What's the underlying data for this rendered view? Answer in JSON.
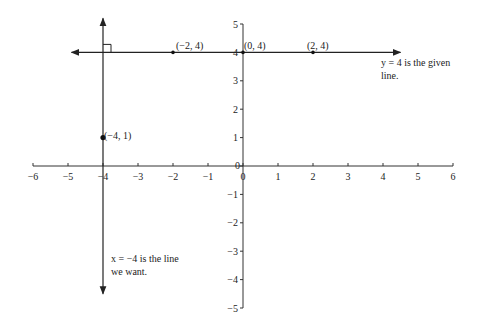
{
  "chart_data": {
    "type": "line",
    "title": "",
    "xlabel": "",
    "ylabel": "",
    "xlim": [
      -6,
      6
    ],
    "ylim": [
      -5,
      5
    ],
    "grid": false,
    "x_ticks": [
      -6,
      -5,
      -4,
      -3,
      -2,
      -1,
      0,
      1,
      2,
      3,
      4,
      5,
      6
    ],
    "y_ticks": [
      -5,
      -4,
      -3,
      -2,
      -1,
      0,
      1,
      2,
      3,
      4,
      5
    ],
    "x_tick_labels": [
      "−6",
      "−5",
      "−4",
      "−3",
      "−2",
      "−1",
      "0",
      "1",
      "2",
      "3",
      "4",
      "5",
      "6"
    ],
    "y_tick_labels": [
      "−5",
      "−4",
      "−3",
      "−2",
      "−1",
      "0",
      "1",
      "2",
      "3",
      "4",
      "5"
    ],
    "series": [
      {
        "name": "y = 4",
        "kind": "horizontal-line",
        "y": 4,
        "x_range": [
          -4.9,
          4.5
        ],
        "arrows": "both"
      },
      {
        "name": "x = −4",
        "kind": "vertical-line",
        "x": -4,
        "y_range": [
          -4.5,
          5.2
        ],
        "arrows": "both"
      }
    ],
    "points": [
      {
        "x": -2,
        "y": 4,
        "label": "(−2, 4)"
      },
      {
        "x": 0,
        "y": 4,
        "label": "(0, 4)"
      },
      {
        "x": 2,
        "y": 4,
        "label": "(2, 4)"
      },
      {
        "x": -4,
        "y": 1,
        "label": "(−4, 1)"
      }
    ],
    "annotations": [
      {
        "text": "y = 4 is the given line.",
        "lines": [
          "y = 4 is the given",
          "line."
        ]
      },
      {
        "text": "x = −4 is the line we want.",
        "lines": [
          "x = −4 is the line",
          "we want."
        ]
      },
      {
        "text": "right-angle marker at (−4, 4)"
      }
    ]
  },
  "labels": {
    "pt_m2_4": "(−2, 4)",
    "pt_0_4": "(0, 4)",
    "pt_2_4": "(2, 4)",
    "pt_m4_1": "(−4, 1)",
    "given_line_1": "y = 4 is the given",
    "given_line_2": "line.",
    "wanted_line_1": "x = −4 is the line",
    "wanted_line_2": "we want."
  }
}
